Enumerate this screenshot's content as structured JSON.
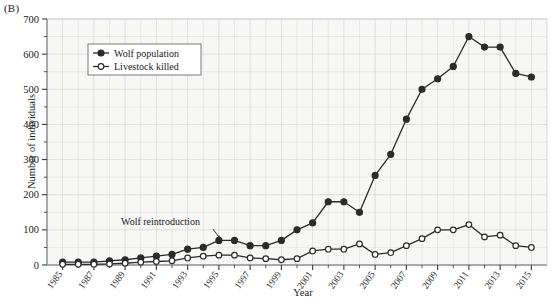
{
  "panel": {
    "label": "(B)"
  },
  "axes": {
    "ylabel": "Number of individuals",
    "xlabel": "Year",
    "yticks": [
      "0",
      "100",
      "200",
      "300",
      "400",
      "500",
      "600",
      "700"
    ],
    "xticks": [
      "1985",
      "1987",
      "1989",
      "1991",
      "1993",
      "1995",
      "1997",
      "1999",
      "2001",
      "2003",
      "2005",
      "2007",
      "2009",
      "2011",
      "2013",
      "2015"
    ]
  },
  "legend": {
    "items": [
      {
        "label": "Wolf population",
        "marker": "filled-circle",
        "color": "#2b2b2b"
      },
      {
        "label": "Livestock killed",
        "marker": "open-circle",
        "color": "#2b2b2b"
      }
    ]
  },
  "annotations": [
    {
      "text": "Wolf reintroduction",
      "x_year": 1995,
      "y_value": 70
    }
  ],
  "colors": {
    "line": "#2b2b2b",
    "grid": "#c9cdd2",
    "axis": "#3a3a3a",
    "plot_bg": "#f7f7f5",
    "page_bg": "#ffffff"
  },
  "chart_data": {
    "type": "line",
    "title": "",
    "xlabel": "Year",
    "ylabel": "Number of individuals",
    "xlim": [
      1984,
      2016
    ],
    "ylim": [
      0,
      700
    ],
    "grid": true,
    "legend_position": "top-left-inside",
    "x": [
      1985,
      1986,
      1987,
      1988,
      1989,
      1990,
      1991,
      1992,
      1993,
      1994,
      1995,
      1996,
      1997,
      1998,
      1999,
      2000,
      2001,
      2002,
      2003,
      2004,
      2005,
      2006,
      2007,
      2008,
      2009,
      2010,
      2011,
      2012,
      2013,
      2014,
      2015
    ],
    "series": [
      {
        "name": "Wolf population",
        "marker": "filled-circle",
        "values": [
          8,
          8,
          8,
          12,
          15,
          20,
          25,
          30,
          45,
          50,
          70,
          70,
          55,
          55,
          70,
          100,
          120,
          180,
          180,
          150,
          255,
          315,
          415,
          500,
          530,
          565,
          650,
          620,
          620,
          545,
          535
        ]
      },
      {
        "name": "Livestock killed",
        "marker": "open-circle",
        "values": [
          2,
          2,
          2,
          3,
          5,
          8,
          10,
          12,
          20,
          25,
          28,
          28,
          20,
          18,
          15,
          18,
          40,
          45,
          45,
          60,
          30,
          35,
          55,
          75,
          100,
          100,
          115,
          80,
          85,
          55,
          50
        ]
      }
    ]
  }
}
